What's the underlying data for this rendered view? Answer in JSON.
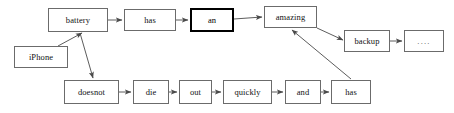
{
  "diagram": {
    "type": "flow-graph",
    "title": "",
    "canvas": {
      "width": 454,
      "height": 113,
      "background": "#ffffff"
    },
    "style": {
      "node_border_color": "#6b6b6b",
      "node_highlight_border_color": "#000000",
      "node_fill": "#ffffff",
      "edge_color": "#4a4a4a",
      "text_color": "#111111"
    },
    "nodes": [
      {
        "id": "battery",
        "label": "battery",
        "x": 48,
        "y": 8,
        "w": 60,
        "h": 24,
        "highlight": false
      },
      {
        "id": "has_top",
        "label": "has",
        "x": 124,
        "y": 9,
        "w": 52,
        "h": 22,
        "highlight": false
      },
      {
        "id": "an",
        "label": "an",
        "x": 190,
        "y": 8,
        "w": 44,
        "h": 24,
        "highlight": true
      },
      {
        "id": "amazing",
        "label": "amazing",
        "x": 264,
        "y": 6,
        "w": 53,
        "h": 22,
        "highlight": false
      },
      {
        "id": "backup",
        "label": "backup",
        "x": 344,
        "y": 30,
        "w": 46,
        "h": 22,
        "highlight": false
      },
      {
        "id": "ellipsis",
        "label": "....",
        "x": 404,
        "y": 30,
        "w": 40,
        "h": 22,
        "highlight": false
      },
      {
        "id": "iphone",
        "label": "iPhone",
        "x": 14,
        "y": 46,
        "w": 54,
        "h": 22,
        "highlight": false
      },
      {
        "id": "doesnot",
        "label": "doesnot",
        "x": 64,
        "y": 80,
        "w": 55,
        "h": 24,
        "highlight": false
      },
      {
        "id": "die",
        "label": "die",
        "x": 133,
        "y": 80,
        "w": 36,
        "h": 24,
        "highlight": false
      },
      {
        "id": "out",
        "label": "out",
        "x": 179,
        "y": 80,
        "w": 33,
        "h": 24,
        "highlight": false
      },
      {
        "id": "quickly",
        "label": "quickly",
        "x": 223,
        "y": 80,
        "w": 49,
        "h": 24,
        "highlight": false
      },
      {
        "id": "and",
        "label": "and",
        "x": 285,
        "y": 80,
        "w": 36,
        "h": 24,
        "highlight": false
      },
      {
        "id": "has_bot",
        "label": "has",
        "x": 331,
        "y": 80,
        "w": 40,
        "h": 24,
        "highlight": false
      }
    ],
    "edges": [
      {
        "id": "e1",
        "from": "battery",
        "to": "has_top",
        "x1": 108,
        "y1": 20,
        "x2": 122,
        "y2": 20
      },
      {
        "id": "e2",
        "from": "has_top",
        "to": "an",
        "x1": 176,
        "y1": 20,
        "x2": 188,
        "y2": 20
      },
      {
        "id": "e3",
        "from": "an",
        "to": "amazing",
        "x1": 234,
        "y1": 19,
        "x2": 262,
        "y2": 17
      },
      {
        "id": "e4",
        "from": "amazing",
        "to": "backup",
        "x1": 317,
        "y1": 28,
        "x2": 343,
        "y2": 40
      },
      {
        "id": "e5",
        "from": "backup",
        "to": "ellipsis",
        "x1": 390,
        "y1": 41,
        "x2": 402,
        "y2": 41
      },
      {
        "id": "e6",
        "from": "iphone",
        "to": "battery",
        "x1": 58,
        "y1": 46,
        "x2": 82,
        "y2": 33
      },
      {
        "id": "e7",
        "from": "battery",
        "to": "doesnot",
        "x1": 80,
        "y1": 33,
        "x2": 93,
        "y2": 78
      },
      {
        "id": "e8",
        "from": "doesnot",
        "to": "die",
        "x1": 119,
        "y1": 92,
        "x2": 131,
        "y2": 92
      },
      {
        "id": "e9",
        "from": "die",
        "to": "out",
        "x1": 169,
        "y1": 92,
        "x2": 177,
        "y2": 92
      },
      {
        "id": "e10",
        "from": "out",
        "to": "quickly",
        "x1": 212,
        "y1": 92,
        "x2": 221,
        "y2": 92
      },
      {
        "id": "e11",
        "from": "quickly",
        "to": "and",
        "x1": 272,
        "y1": 92,
        "x2": 283,
        "y2": 92
      },
      {
        "id": "e12",
        "from": "and",
        "to": "has_bot",
        "x1": 321,
        "y1": 92,
        "x2": 329,
        "y2": 92
      },
      {
        "id": "e13",
        "from": "has_bot",
        "to": "amazing",
        "x1": 351,
        "y1": 79,
        "x2": 292,
        "y2": 30
      }
    ]
  }
}
